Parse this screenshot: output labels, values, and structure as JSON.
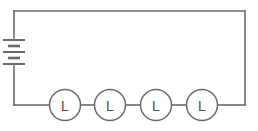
{
  "diagram": {
    "type": "electrical-schematic",
    "background_color": "#ffffff",
    "wire_color": "#6a6a6a",
    "label_color": "#4e4e4e",
    "canvas": {
      "width": 258,
      "height": 131
    },
    "loop": {
      "left_x": 14,
      "right_x": 245,
      "top_y": 11,
      "bottom_y": 105
    },
    "battery": {
      "name": "battery",
      "orientation": "vertical",
      "center_x": 14,
      "center_y": 50,
      "plate_count": 4,
      "plates": [
        {
          "kind": "long",
          "y": 40,
          "half_width": 11
        },
        {
          "kind": "short",
          "y": 46,
          "half_width": 6
        },
        {
          "kind": "long",
          "y": 52,
          "half_width": 11
        },
        {
          "kind": "short",
          "y": 58,
          "half_width": 6
        },
        {
          "kind": "long",
          "y": 64,
          "half_width": 11
        }
      ]
    },
    "lamps": [
      {
        "id": "lamp-1",
        "label": "L",
        "cx": 65,
        "cy": 105,
        "r": 15.5
      },
      {
        "id": "lamp-2",
        "label": "L",
        "cx": 110,
        "cy": 105,
        "r": 15.5
      },
      {
        "id": "lamp-3",
        "label": "L",
        "cx": 156,
        "cy": 105,
        "r": 15.5
      },
      {
        "id": "lamp-4",
        "label": "L",
        "cx": 202,
        "cy": 105,
        "r": 15.5
      }
    ],
    "wire_segments": [
      {
        "name": "left-wire-upper",
        "d": "M 14 11 L 14 38"
      },
      {
        "name": "left-wire-lower",
        "d": "M 14 66 L 14 105"
      },
      {
        "name": "top-wire",
        "d": "M 14 11 L 245 11"
      },
      {
        "name": "right-wire",
        "d": "M 245 11 L 245 105"
      },
      {
        "name": "bottom-wire-a",
        "d": "M 14 105 L 49.5 105"
      },
      {
        "name": "bottom-wire-b",
        "d": "M 80.5 105 L 94.5 105"
      },
      {
        "name": "bottom-wire-c",
        "d": "M 125.5 105 L 140.5 105"
      },
      {
        "name": "bottom-wire-d",
        "d": "M 171.5 105 L 186.5 105"
      },
      {
        "name": "bottom-wire-e",
        "d": "M 217.5 105 L 245 105"
      }
    ]
  }
}
